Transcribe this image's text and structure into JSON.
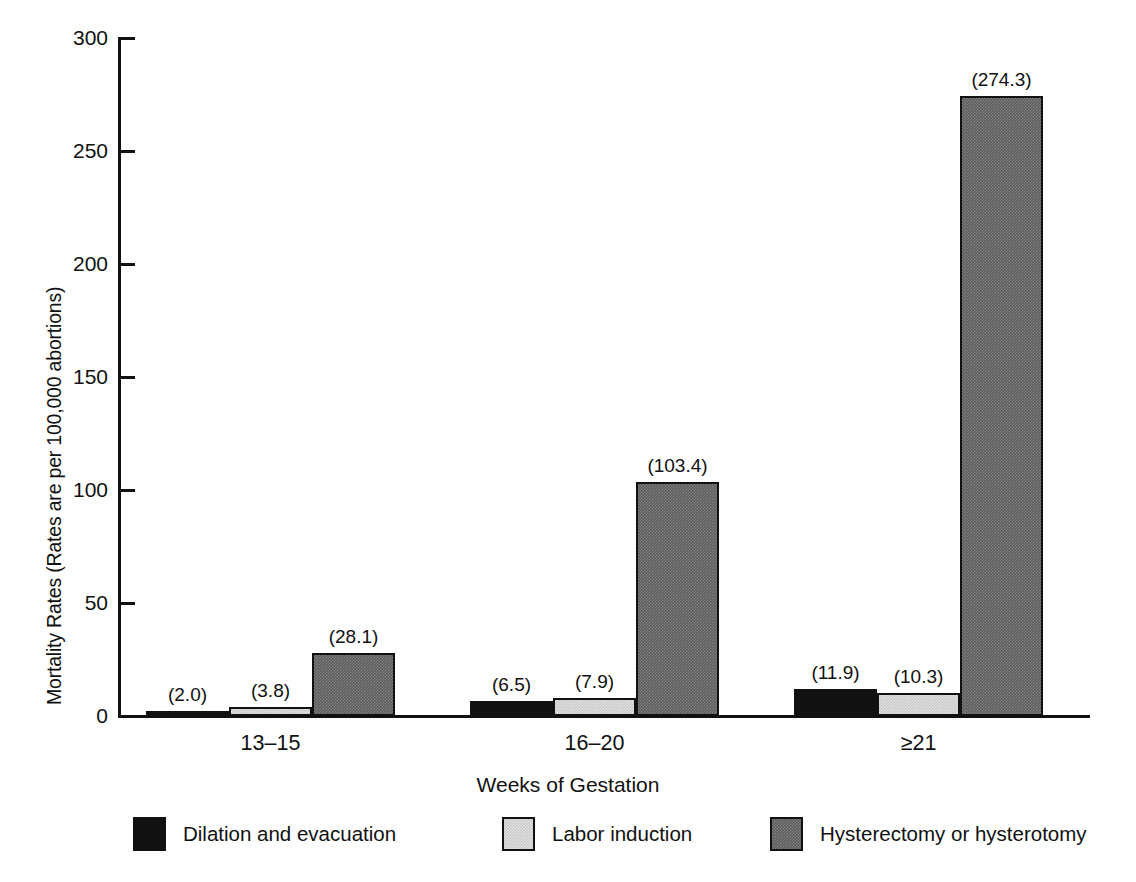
{
  "chart_data": {
    "type": "bar",
    "title": "",
    "subtitle": "",
    "xlabel": "Weeks of Gestation",
    "ylabel": "Mortality Rates (Rates are per 100,000 abortions)",
    "categories": [
      "13–15",
      "16–20",
      "≥21"
    ],
    "series": [
      {
        "name": "Dilation and evacuation",
        "color": "#111111",
        "values": [
          2.0,
          6.5,
          11.9
        ],
        "labels": [
          "(2.0)",
          "(6.5)",
          "(11.9)"
        ]
      },
      {
        "name": "Labor induction",
        "color": "#c9c9c9",
        "values": [
          3.8,
          7.9,
          10.3
        ],
        "labels": [
          "(3.8)",
          "(7.9)",
          "(10.3)"
        ]
      },
      {
        "name": "Hysterectomy or hysterotomy",
        "color": "#5b5b5b",
        "values": [
          28.1,
          103.4,
          274.3
        ],
        "labels": [
          "(28.1)",
          "(103.4)",
          "(274.3)"
        ]
      }
    ],
    "ylim": [
      0,
      300
    ],
    "yticks": [
      0,
      50,
      100,
      150,
      200,
      250,
      300
    ],
    "ytick_labels": [
      "0",
      "50",
      "100",
      "150",
      "200",
      "250",
      "300"
    ],
    "grid": false,
    "legend_position": "bottom",
    "value_label_format": "(value) above each bar"
  }
}
